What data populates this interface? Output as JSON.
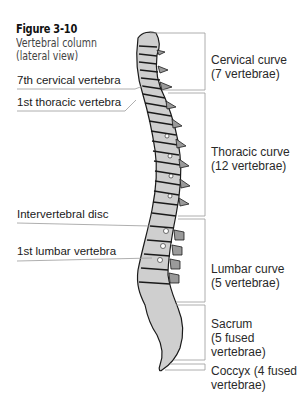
{
  "figure": {
    "number": "Figure 3-10",
    "subtitle_line1": "Vertebral column",
    "subtitle_line2": "(lateral view)"
  },
  "left_labels": [
    {
      "text": "7th cervical vertebra"
    },
    {
      "text": "1st thoracic vertebra"
    },
    {
      "text": "Intervertebral disc"
    },
    {
      "text": "1st lumbar vertebra"
    }
  ],
  "right_labels": [
    {
      "line1": "Cervical curve",
      "line2": "(7 vertebrae)"
    },
    {
      "line1": "Thoracic curve",
      "line2": "(12 vertebrae)"
    },
    {
      "line1": "Lumbar curve",
      "line2": "(5 vertebrae)"
    },
    {
      "line1": "Sacrum",
      "line2": "(5 fused",
      "line3": "vertebrae)"
    },
    {
      "line1": "Coccyx (4 fused",
      "line2": "vertebrae)"
    }
  ],
  "colors": {
    "bone": "#cfcfcf",
    "outline": "#1a1a1a",
    "leader": "#9a9a9a"
  }
}
